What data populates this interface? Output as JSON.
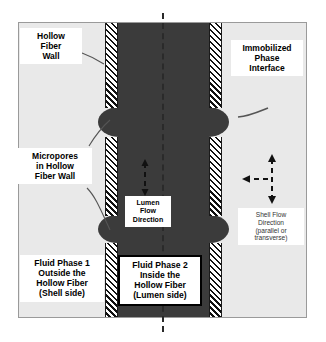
{
  "diagram": {
    "colors": {
      "shell_fill": "#e9e9e9",
      "lumen_fill": "#3b3b3b",
      "wall_hatch": "#111111",
      "frame_border": "#9a9a9a",
      "axis_line": "#2a2a2a",
      "label_text": "#000000"
    }
  },
  "labels": {
    "hollow_fiber_wall": "Hollow\nFiber\nWall",
    "hollow_fiber_wall_lines": [
      "Hollow",
      "Fiber",
      "Wall"
    ],
    "immobilized_phase_interface": "Immobilized\nPhase\nInterface",
    "immobilized_phase_interface_lines": [
      "Immobilized",
      "Phase",
      "Interface"
    ],
    "micropores": "Micropores\nin Hollow\nFiber Wall",
    "micropores_lines": [
      "Micropores",
      "in Hollow",
      "Fiber Wall"
    ],
    "lumen_flow_direction": "Lumen\nFlow\nDirection",
    "lumen_flow_direction_lines": [
      "Lumen",
      "Flow",
      "Direction"
    ],
    "shell_flow_direction": "Shell Flow\nDirection\n(parallel or\ntransverse)",
    "shell_flow_direction_lines": [
      "Shell Flow",
      "Direction",
      "(parallel or",
      "transverse)"
    ],
    "fluid_phase_1": "Fluid Phase 1\nOutside the\nHollow Fiber\n(Shell side)",
    "fluid_phase_1_lines": [
      "Fluid Phase 1",
      "Outside the",
      "Hollow Fiber",
      "(Shell side)"
    ],
    "fluid_phase_2": "Fluid Phase 2\nInside the\nHollow Fiber\n(Lumen side)",
    "fluid_phase_2_lines": [
      "Fluid Phase 2",
      "Inside the",
      "Hollow Fiber",
      "(Lumen side)"
    ]
  },
  "icons": {
    "lumen_arrow": "dashed-double-arrow-vertical-icon",
    "shell_arrow_vertical": "dashed-double-arrow-vertical-icon",
    "shell_arrow_horizontal": "dashed-arrow-left-icon",
    "center_axis": "dash-dot-centerline-icon",
    "leader_line": "leader-line-icon"
  },
  "regions": {
    "shell_side": "Shell side (Fluid Phase 1)",
    "lumen_side": "Lumen side (Fluid Phase 2)",
    "fiber_wall": "Microporous hollow fiber wall"
  }
}
